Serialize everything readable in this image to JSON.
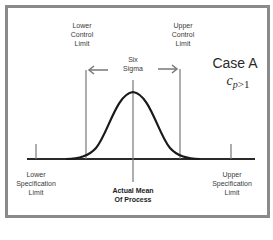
{
  "diagram": {
    "title": "Case A",
    "capability": {
      "symbol": "c",
      "subscript": "p",
      "relation": ">1"
    },
    "labels": {
      "lower_control_limit": [
        "Lower",
        "Control",
        "Limit"
      ],
      "upper_control_limit": [
        "Upper",
        "Control",
        "Limit"
      ],
      "six_sigma": [
        "Six",
        "Sigma"
      ],
      "lower_specification_limit": [
        "Lower",
        "Specification",
        "Limit"
      ],
      "upper_specification_limit": [
        "Upper",
        "Specification",
        "Limit"
      ],
      "actual_mean": [
        "Actual Mean",
        "Of Process"
      ]
    },
    "colors": {
      "frame": "#8a8a8a",
      "lines": "#777777",
      "curve": "#1a1a1a",
      "baseline": "#2a2a2a",
      "text": "#3a3a3a"
    }
  }
}
